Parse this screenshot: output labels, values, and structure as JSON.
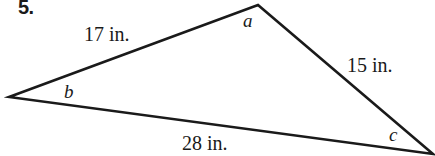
{
  "figure": {
    "problem_number": "5.",
    "shape": "triangle",
    "stroke_color": "#1a1a1a",
    "background_color": "#ffffff",
    "vertices": {
      "left": {
        "x": 9,
        "y": 97
      },
      "apex": {
        "x": 258,
        "y": 5
      },
      "right": {
        "x": 433,
        "y": 154
      }
    },
    "side_labels": [
      {
        "id": "side-17",
        "text": "17 in.",
        "value": 17,
        "unit": "in.",
        "between": [
          "left",
          "apex"
        ]
      },
      {
        "id": "side-15",
        "text": "15 in.",
        "value": 15,
        "unit": "in.",
        "between": [
          "apex",
          "right"
        ]
      },
      {
        "id": "side-28",
        "text": "28 in.",
        "value": 28,
        "unit": "in.",
        "between": [
          "left",
          "right"
        ]
      }
    ],
    "angle_labels": [
      {
        "id": "angle-a",
        "text": "a",
        "at_vertex": "apex"
      },
      {
        "id": "angle-b",
        "text": "b",
        "at_vertex": "left"
      },
      {
        "id": "angle-c",
        "text": "c",
        "at_vertex": "right"
      }
    ]
  }
}
